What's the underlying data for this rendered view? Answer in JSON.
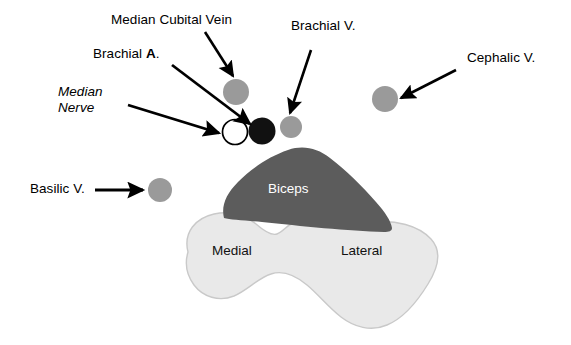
{
  "figure": {
    "background_color": "#ffffff"
  },
  "colors": {
    "vessel_gray": "#9a9a9a",
    "vessel_gray_light": "#a3a3a3",
    "artery_black": "#111111",
    "nerve_outline": "#000000",
    "nerve_fill": "#ffffff",
    "biceps_fill": "#5c5c5c",
    "muscle_fill": "#e9e9e9",
    "muscle_stroke": "#c9c9c9",
    "arrow_color": "#000000",
    "label_color": "#000000",
    "biceps_label_color": "#ffffff"
  },
  "labels": {
    "median_cubital_vein": "Median Cubital Vein",
    "brachial_artery_prefix": "Brachial ",
    "brachial_artery_bold": "A",
    "brachial_artery_suffix": ".",
    "median_nerve_line1": "Median",
    "median_nerve_line2": "Nerve",
    "brachial_vein": "Brachial V.",
    "cephalic_vein": "Cephalic V.",
    "basilic_vein": "Basilic V."
  },
  "structures": {
    "biceps": "Biceps",
    "medial": "Medial",
    "lateral": "Lateral"
  },
  "vessels": [
    {
      "name": "median-cubital-vein",
      "type": "vein",
      "cx": 236,
      "cy": 92,
      "r": 13,
      "fill": "#9a9a9a"
    },
    {
      "name": "median-nerve",
      "type": "nerve",
      "cx": 235,
      "cy": 132,
      "r": 13,
      "fill": "#ffffff"
    },
    {
      "name": "brachial-artery",
      "type": "artery",
      "cx": 262,
      "cy": 131,
      "r": 13,
      "fill": "#111111"
    },
    {
      "name": "brachial-vein",
      "type": "vein",
      "cx": 291,
      "cy": 127,
      "r": 11,
      "fill": "#9a9a9a"
    },
    {
      "name": "cephalic-vein",
      "type": "vein",
      "cx": 385,
      "cy": 99,
      "r": 13,
      "fill": "#9a9a9a"
    },
    {
      "name": "basilic-vein",
      "type": "vein",
      "cx": 160,
      "cy": 190,
      "r": 12,
      "fill": "#9a9a9a"
    }
  ],
  "arrows": [
    {
      "name": "arrow-median-cubital-vein",
      "x1": 205,
      "y1": 32,
      "x2": 234,
      "y2": 77
    },
    {
      "name": "arrow-brachial-artery",
      "x1": 172,
      "y1": 65,
      "x2": 249,
      "y2": 124
    },
    {
      "name": "arrow-median-nerve",
      "x1": 128,
      "y1": 105,
      "x2": 218,
      "y2": 133
    },
    {
      "name": "arrow-brachial-vein",
      "x1": 310,
      "y1": 50,
      "x2": 289,
      "y2": 113
    },
    {
      "name": "arrow-cephalic-vein",
      "x1": 455,
      "y1": 70,
      "x2": 400,
      "y2": 98
    },
    {
      "name": "arrow-basilic-vein",
      "x1": 95,
      "y1": 190,
      "x2": 144,
      "y2": 190
    }
  ],
  "label_positions": {
    "median_cubital_vein": {
      "left": 111,
      "top": 12
    },
    "brachial_artery": {
      "left": 93,
      "top": 46
    },
    "median_nerve": {
      "left": 58,
      "top": 84
    },
    "brachial_vein": {
      "left": 291,
      "top": 18
    },
    "cephalic_vein": {
      "left": 467,
      "top": 50
    },
    "basilic_vein": {
      "left": 30,
      "top": 181
    },
    "biceps": {
      "left": 268,
      "top": 181
    },
    "medial": {
      "left": 212,
      "top": 243
    },
    "lateral": {
      "left": 341,
      "top": 243
    }
  }
}
